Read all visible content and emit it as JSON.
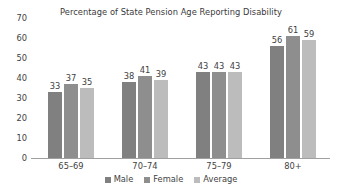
{
  "chart_data": {
    "type": "bar",
    "title": "Percentage of State Pension Age Reporting Disability",
    "xlabel": "",
    "ylabel": "",
    "ylim": [
      0,
      70
    ],
    "yticks": [
      0,
      10,
      20,
      30,
      40,
      50,
      60,
      70
    ],
    "grid": false,
    "legend_position": "bottom",
    "categories": [
      "65–69",
      "70–74",
      "75–79",
      "80+"
    ],
    "series": [
      {
        "name": "Male",
        "color": "#808080",
        "values": [
          33,
          38,
          43,
          56
        ]
      },
      {
        "name": "Female",
        "color": "#8e8e8e",
        "values": [
          37,
          41,
          43,
          61
        ]
      },
      {
        "name": "Average",
        "color": "#bcbcbc",
        "values": [
          35,
          39,
          43,
          59
        ]
      }
    ]
  },
  "axis": {
    "tick_labels": [
      "70",
      "60",
      "50",
      "40",
      "30",
      "20",
      "10",
      "0"
    ]
  },
  "legend": {
    "items": [
      {
        "label": "Male",
        "color": "#808080"
      },
      {
        "label": "Female",
        "color": "#8e8e8e"
      },
      {
        "label": "Average",
        "color": "#bcbcbc"
      }
    ]
  }
}
